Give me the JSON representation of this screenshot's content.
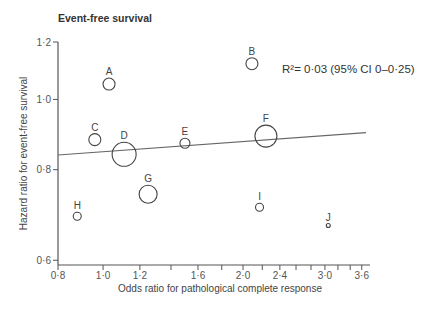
{
  "chart_data": {
    "type": "scatter",
    "title": "Event-free survival",
    "xlabel": "Odds ratio for pathological complete response",
    "ylabel": "Hazard ratio for event-free survival",
    "xscale": "log",
    "yscale": "log",
    "xlim": [
      0.8,
      3.7
    ],
    "ylim": [
      0.6,
      1.2
    ],
    "x_ticks": [
      {
        "value": 0.8,
        "label": "0·8"
      },
      {
        "value": 1.0,
        "label": "1·0"
      },
      {
        "value": 1.2,
        "label": "1·2"
      },
      {
        "value": 1.4,
        "label": ""
      },
      {
        "value": 1.6,
        "label": "1·6"
      },
      {
        "value": 1.8,
        "label": ""
      },
      {
        "value": 2.0,
        "label": "2·0"
      },
      {
        "value": 2.2,
        "label": ""
      },
      {
        "value": 2.4,
        "label": "2·4"
      },
      {
        "value": 2.6,
        "label": ""
      },
      {
        "value": 2.8,
        "label": ""
      },
      {
        "value": 3.0,
        "label": "3·0"
      },
      {
        "value": 3.2,
        "label": ""
      },
      {
        "value": 3.4,
        "label": ""
      },
      {
        "value": 3.6,
        "label": "3·6"
      }
    ],
    "y_ticks": [
      {
        "value": 0.6,
        "label": "0·6"
      },
      {
        "value": 0.8,
        "label": "0·8"
      },
      {
        "value": 1.0,
        "label": "1·0"
      },
      {
        "value": 1.2,
        "label": "1·2"
      }
    ],
    "grid": false,
    "points": [
      {
        "label": "A",
        "x": 1.03,
        "y": 1.05,
        "size": 6
      },
      {
        "label": "B",
        "x": 2.09,
        "y": 1.12,
        "size": 6
      },
      {
        "label": "C",
        "x": 0.96,
        "y": 0.88,
        "size": 6
      },
      {
        "label": "D",
        "x": 1.11,
        "y": 0.84,
        "size": 12
      },
      {
        "label": "E",
        "x": 1.5,
        "y": 0.87,
        "size": 5
      },
      {
        "label": "F",
        "x": 2.24,
        "y": 0.89,
        "size": 11
      },
      {
        "label": "G",
        "x": 1.25,
        "y": 0.74,
        "size": 9
      },
      {
        "label": "H",
        "x": 0.88,
        "y": 0.69,
        "size": 4
      },
      {
        "label": "I",
        "x": 2.17,
        "y": 0.71,
        "size": 4
      },
      {
        "label": "J",
        "x": 3.05,
        "y": 0.67,
        "size": 2
      }
    ],
    "regression_line": {
      "x": [
        0.8,
        3.7
      ],
      "y": [
        0.838,
        0.9
      ]
    },
    "annotation": "R²= 0·03   (95% CI 0–0·25)"
  },
  "labels": {
    "title": "Event-free survival",
    "xlabel": "Odds ratio for pathological complete response",
    "ylabel": "Hazard ratio for event-free survival",
    "annotation": "R²= 0·03   (95% CI 0–0·25)"
  }
}
